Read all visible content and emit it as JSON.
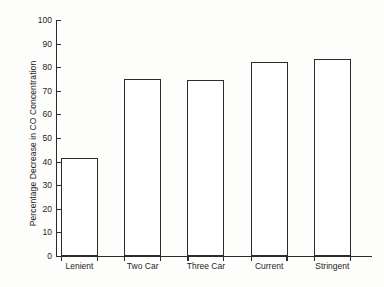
{
  "chart_data": {
    "type": "bar",
    "title": "",
    "subtitle": "",
    "xlabel": "",
    "ylabel": "Percentage Decrease in CO Concentration",
    "categories": [
      "Lenient",
      "Two Car",
      "Three Car",
      "Current",
      "Stringent"
    ],
    "values": [
      41.5,
      75,
      74.5,
      82,
      83.5
    ],
    "series": [
      {
        "name": "Percentage Decrease in CO Concentration",
        "values": [
          41.5,
          75,
          74.5,
          82,
          83.5
        ]
      }
    ],
    "ylim": [
      0,
      100
    ],
    "ytick_labels": [
      "0",
      "10",
      "20",
      "30",
      "40",
      "50",
      "60",
      "70",
      "80",
      "90",
      "100"
    ],
    "ytick_values": [
      0,
      10,
      20,
      30,
      40,
      50,
      60,
      70,
      80,
      90,
      100
    ],
    "grid": false,
    "legend": false,
    "legend_position": "none",
    "bar_fill": "#ffffff",
    "bar_edge_color": "#2b2b2b",
    "axis_color": "#2b2b2b",
    "background_color": "#fdfdfc"
  }
}
